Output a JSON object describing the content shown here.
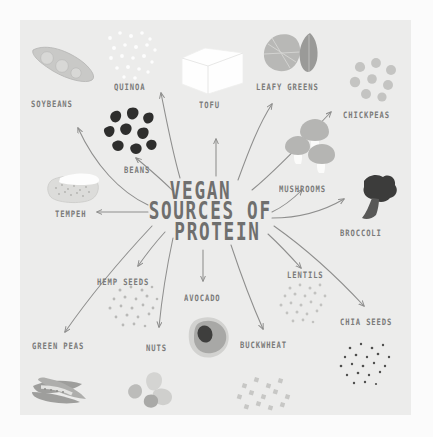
{
  "poster": {
    "title_lines": [
      "VEGAN",
      "SOURCES OF",
      "PROTEIN"
    ],
    "title_full": "VEGAN SOURCES OF PROTEIN",
    "background_color": "#fbfbfb",
    "panel_color": "#ececeb",
    "ink_color": "#7b7b7a",
    "title_color": "#6f6f6e",
    "arrow_color": "#8e8e8d"
  },
  "items": [
    {
      "label": "SOYBEANS",
      "icon": "soybean-pod-icon"
    },
    {
      "label": "QUINOA",
      "icon": "quinoa-grains-icon"
    },
    {
      "label": "TOFU",
      "icon": "tofu-cube-icon"
    },
    {
      "label": "LEAFY GREENS",
      "icon": "leafy-greens-icon"
    },
    {
      "label": "CHICKPEAS",
      "icon": "chickpeas-icon"
    },
    {
      "label": "BEANS",
      "icon": "beans-icon"
    },
    {
      "label": "MUSHROOMS",
      "icon": "mushrooms-icon"
    },
    {
      "label": "BROCCOLI",
      "icon": "broccoli-icon"
    },
    {
      "label": "TEMPEH",
      "icon": "tempeh-block-icon"
    },
    {
      "label": "HEMP SEEDS",
      "icon": "hemp-seeds-icon"
    },
    {
      "label": "AVOCADO",
      "icon": "avocado-icon"
    },
    {
      "label": "LENTILS",
      "icon": "lentils-icon"
    },
    {
      "label": "GREEN PEAS",
      "icon": "green-peas-pods-icon"
    },
    {
      "label": "NUTS",
      "icon": "nuts-icon"
    },
    {
      "label": "BUCKWHEAT",
      "icon": "buckwheat-grains-icon"
    },
    {
      "label": "CHIA SEEDS",
      "icon": "chia-seeds-icon"
    }
  ]
}
